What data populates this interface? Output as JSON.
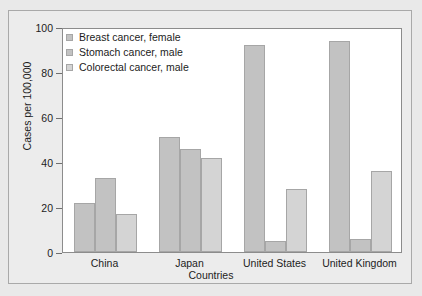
{
  "chart_data": {
    "type": "bar",
    "title": "",
    "xlabel": "Countries",
    "ylabel": "Cases per 100,000",
    "categories": [
      "China",
      "Japan",
      "United States",
      "United Kingdom"
    ],
    "series": [
      {
        "name": "Breast cancer, female",
        "values": [
          22,
          51,
          92,
          94
        ],
        "color": "#c2c2c2"
      },
      {
        "name": "Stomach cancer, male",
        "values": [
          33,
          46,
          5,
          6
        ],
        "color": "#c2c2c2"
      },
      {
        "name": "Colorectal cancer, male",
        "values": [
          17,
          42,
          28,
          36
        ],
        "color": "#d4d4d4"
      }
    ],
    "ylim": [
      0,
      100
    ],
    "yticks": [
      0,
      20,
      40,
      60,
      80,
      100
    ],
    "ytick_labels": [
      "0",
      "20",
      "40",
      "60",
      "80",
      "100"
    ],
    "grid": false,
    "legend_position": "upper left"
  },
  "colors": {
    "background": "#e9e9e9",
    "plot_background": "#ffffff",
    "frame": "#a9a9a9",
    "axis": "#8c8c8c",
    "text": "#1c1c1c"
  }
}
